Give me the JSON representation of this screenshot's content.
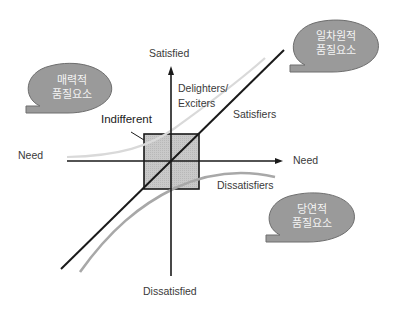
{
  "diagram": {
    "axes": {
      "y_top": "Satisfied",
      "y_bottom": "Dissatisfied",
      "x_left": "Need",
      "x_right": "Need"
    },
    "curves": {
      "delighters": {
        "line1": "Delighters/",
        "line2": "Exciters",
        "color": "#d9d9d9"
      },
      "satisfiers": {
        "label": "Satisfiers",
        "color": "#1a1a1a"
      },
      "dissatisfiers": {
        "label": "Dissatisfiers",
        "color": "#a8a8a8"
      }
    },
    "indifferent": {
      "label": "Indifferent",
      "fill": "#c8c8c8"
    },
    "bubbles": {
      "attractive": {
        "line1": "매력적",
        "line2": "품질요소"
      },
      "one_dimensional": {
        "line1": "일차원적",
        "line2": "품질요소"
      },
      "must_be": {
        "line1": "당연적",
        "line2": "품질요소"
      },
      "fill": "#9a9a9a",
      "stroke": "#6e6e6e"
    }
  }
}
